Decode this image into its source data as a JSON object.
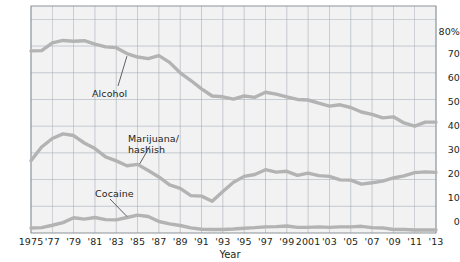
{
  "chart_data": {
    "type": "line",
    "title": "",
    "xlabel": "Year",
    "ylabel": "",
    "ylim": [
      0,
      85
    ],
    "xlim": [
      1975,
      2013
    ],
    "grid": true,
    "legend": "inline-annotations",
    "y_ticks": [
      0,
      10,
      20,
      30,
      40,
      50,
      60,
      70,
      80
    ],
    "y_tick_labels": [
      "0",
      "10",
      "20",
      "30",
      "40",
      "50",
      "60",
      "70",
      "80%"
    ],
    "x_ticks": [
      1975,
      1977,
      1979,
      1981,
      1983,
      1985,
      1987,
      1989,
      1991,
      1993,
      1995,
      1997,
      1999,
      2001,
      2003,
      2005,
      2007,
      2009,
      2011,
      2013
    ],
    "x_tick_labels": [
      "1975",
      "'77",
      "'79",
      "'81",
      "'83",
      "'85",
      "'87",
      "'89",
      "'91",
      "'93",
      "'95",
      "'97",
      "'99",
      "2001",
      "'03",
      "'05",
      "'07",
      "'09",
      "'11",
      "'13"
    ],
    "x": [
      1975,
      1976,
      1977,
      1978,
      1979,
      1980,
      1981,
      1982,
      1983,
      1984,
      1985,
      1986,
      1987,
      1988,
      1989,
      1990,
      1991,
      1992,
      1993,
      1994,
      1995,
      1996,
      1997,
      1998,
      1999,
      2000,
      2001,
      2002,
      2003,
      2004,
      2005,
      2006,
      2007,
      2008,
      2009,
      2010,
      2011,
      2012,
      2013
    ],
    "series": [
      {
        "name": "Alcohol",
        "color": "#b3b3b3",
        "label_text": "Alcohol",
        "values": [
          68.2,
          68.3,
          71.2,
          72.1,
          71.8,
          72.0,
          70.7,
          69.7,
          69.4,
          67.2,
          65.9,
          65.3,
          66.4,
          63.9,
          60.0,
          57.1,
          54.0,
          51.3,
          51.0,
          50.1,
          51.3,
          50.8,
          52.7,
          52.0,
          51.0,
          50.0,
          49.8,
          48.6,
          47.5,
          48.0,
          47.0,
          45.3,
          44.4,
          43.1,
          43.5,
          41.2,
          40.0,
          41.5,
          41.5
        ]
      },
      {
        "name": "Marijuana/hashish",
        "color": "#b3b3b3",
        "label_text": "Marijuana/\nhashish",
        "values": [
          27.1,
          32.2,
          35.4,
          37.1,
          36.5,
          33.7,
          31.6,
          28.5,
          27.0,
          25.2,
          25.7,
          23.4,
          21.0,
          18.0,
          16.7,
          14.0,
          13.8,
          11.9,
          15.5,
          19.0,
          21.2,
          21.9,
          23.7,
          22.8,
          23.1,
          21.6,
          22.4,
          21.5,
          21.2,
          19.9,
          19.8,
          18.3,
          18.8,
          19.4,
          20.6,
          21.4,
          22.6,
          22.9,
          22.7
        ]
      },
      {
        "name": "Cocaine",
        "color": "#b3b3b3",
        "label_text": "Cocaine",
        "values": [
          1.9,
          2.0,
          2.9,
          3.9,
          5.7,
          5.2,
          5.8,
          5.0,
          4.9,
          5.8,
          6.7,
          6.2,
          4.3,
          3.4,
          2.8,
          1.9,
          1.4,
          1.3,
          1.3,
          1.5,
          1.8,
          2.0,
          2.3,
          2.4,
          2.6,
          2.1,
          2.1,
          2.3,
          2.1,
          2.3,
          2.3,
          2.5,
          2.0,
          1.9,
          1.3,
          1.3,
          1.1,
          1.1,
          1.1
        ]
      }
    ],
    "annotations": [
      {
        "text": "Alcohol",
        "target_year": 1984,
        "target_value": 66.2
      },
      {
        "text": "Marijuana/\nhashish",
        "target_year": 1985,
        "target_value": 25.7
      },
      {
        "text": "Cocaine",
        "target_year": 1984,
        "target_value": 5.8
      }
    ],
    "colors": {
      "line": "#b3b3b3",
      "grid": "#9aa4b0",
      "frame": "#8d9399",
      "plot_background": "#f2f2f2",
      "text": "#231f20",
      "page_background": "#ffffff"
    }
  },
  "axis_title": {
    "x": "Year"
  }
}
